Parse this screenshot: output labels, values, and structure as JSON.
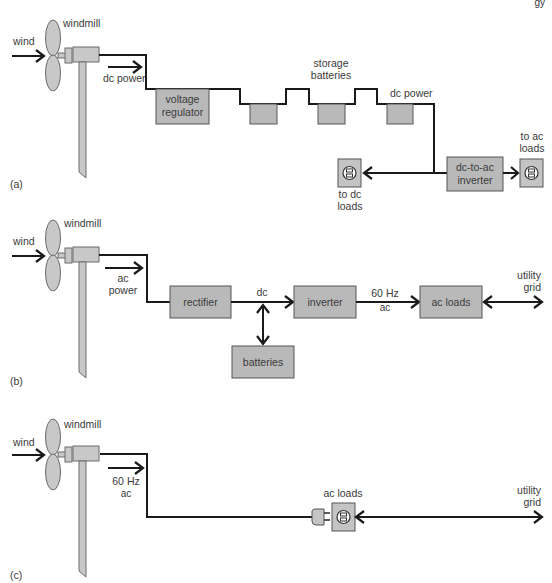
{
  "page": {
    "corner_fragment": "gy"
  },
  "diagrams": [
    {
      "id": "a",
      "panel_label": "(a)",
      "wind_label": "wind",
      "windmill_label": "windmill",
      "flow_label": "dc power",
      "regulator": {
        "line1": "voltage",
        "line2": "regulator"
      },
      "storage_label": {
        "line1": "storage",
        "line2": "batteries"
      },
      "dc_power_label": "dc power",
      "inverter": {
        "line1": "dc-to-ac",
        "line2": "inverter"
      },
      "dc_loads": {
        "line1": "to dc",
        "line2": "loads"
      },
      "ac_loads": {
        "line1": "to ac",
        "line2": "loads"
      }
    },
    {
      "id": "b",
      "panel_label": "(b)",
      "wind_label": "wind",
      "windmill_label": "windmill",
      "flow_label": {
        "line1": "ac",
        "line2": "power"
      },
      "rectifier": "rectifier",
      "dc_label": "dc",
      "batteries": "batteries",
      "inverter": "inverter",
      "freq_label": {
        "line1": "60 Hz",
        "line2": "ac"
      },
      "ac_loads": "ac loads",
      "grid": {
        "line1": "utility",
        "line2": "grid"
      }
    },
    {
      "id": "c",
      "panel_label": "(c)",
      "wind_label": "wind",
      "windmill_label": "windmill",
      "flow_label": {
        "line1": "60 Hz",
        "line2": "ac"
      },
      "ac_loads": "ac loads",
      "grid": {
        "line1": "utility",
        "line2": "grid"
      }
    }
  ],
  "colors": {
    "box_fill": "#b9b9b9",
    "windmill_fill": "#c8c8c8",
    "line": "#1a1a1a",
    "text": "#3a3a3a"
  }
}
